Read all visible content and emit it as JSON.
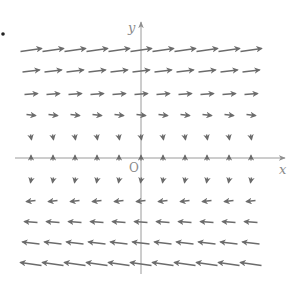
{
  "figure": {
    "title_fragment": "",
    "bullet_dot": {
      "x": 3,
      "y": 34
    },
    "colors": {
      "arrow": "#6b6b6b",
      "axis": "#9a9a9a",
      "label": "#8a8a8a",
      "background": "#ffffff"
    },
    "axes": {
      "x_label": "x",
      "y_label": "y",
      "origin_label": "O",
      "origin_px": {
        "x": 141,
        "y": 158
      },
      "x_axis_px": {
        "from": 15,
        "to": 285
      },
      "y_axis_px": {
        "from": 274,
        "to": 22
      }
    },
    "grid": {
      "columns_px": [
        31,
        53,
        75,
        97,
        119,
        141,
        163,
        185,
        207,
        229,
        251
      ],
      "rows": [
        {
          "y": 50,
          "dx": 21,
          "dy": -3
        },
        {
          "y": 71,
          "dx": 17,
          "dy": -2
        },
        {
          "y": 94,
          "dx": 13,
          "dy": -1
        },
        {
          "y": 115,
          "dx": 9,
          "dy": 1
        },
        {
          "y": 137,
          "dx": 1,
          "dy": 5
        },
        {
          "y": 158,
          "dx": 0,
          "dy": -5
        },
        {
          "y": 180,
          "dx": -1,
          "dy": 5
        },
        {
          "y": 201,
          "dx": -9,
          "dy": 1
        },
        {
          "y": 222,
          "dx": -13,
          "dy": -1
        },
        {
          "y": 243,
          "dx": -17,
          "dy": -2
        },
        {
          "y": 264,
          "dx": -21,
          "dy": -3
        }
      ]
    }
  }
}
